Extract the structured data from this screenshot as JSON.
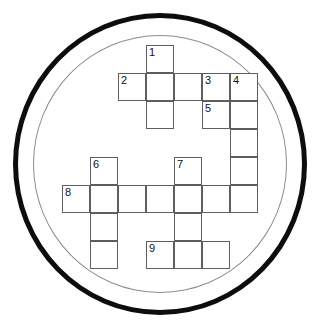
{
  "puzzle": {
    "title": "Circular Crossword Grid",
    "shape": "circle",
    "type": "crossword",
    "cell_size": 28,
    "origin_x": 62,
    "origin_y": 45,
    "columns": 7,
    "rows": 8,
    "frame": {
      "outer_ring_color": "#0d0d0d",
      "outer_ring_width": 5,
      "inner_ring_color": "#8c8c8c",
      "inner_ring_width": 1,
      "background": "#ffffff"
    },
    "grid_line_color": "#5e5e5e",
    "cell_fill": "#ffffff",
    "number_color": "#111111",
    "clue_numbers": [
      "1",
      "2",
      "3",
      "4",
      "5",
      "6",
      "7",
      "8",
      "9"
    ],
    "entries": [
      {
        "number": "1",
        "direction": "down",
        "row": 0,
        "col": 3,
        "length": 3
      },
      {
        "number": "2",
        "direction": "across",
        "row": 1,
        "col": 2,
        "length": 5
      },
      {
        "number": "3",
        "direction": "down",
        "row": 1,
        "col": 5,
        "length": 2
      },
      {
        "number": "4",
        "direction": "down",
        "row": 1,
        "col": 6,
        "length": 5
      },
      {
        "number": "5",
        "direction": "across",
        "row": 2,
        "col": 5,
        "length": 2
      },
      {
        "number": "6",
        "direction": "down",
        "row": 4,
        "col": 1,
        "length": 5
      },
      {
        "number": "7",
        "direction": "down",
        "row": 4,
        "col": 4,
        "length": 4
      },
      {
        "number": "8",
        "direction": "across",
        "row": 5,
        "col": 0,
        "length": 7
      },
      {
        "number": "9",
        "direction": "across",
        "row": 7,
        "col": 3,
        "length": 3
      }
    ],
    "cells": [
      {
        "row": 0,
        "col": 3,
        "number": "1",
        "letter": ""
      },
      {
        "row": 1,
        "col": 2,
        "number": "2",
        "letter": ""
      },
      {
        "row": 1,
        "col": 3,
        "number": "",
        "letter": ""
      },
      {
        "row": 1,
        "col": 4,
        "number": "",
        "letter": ""
      },
      {
        "row": 1,
        "col": 5,
        "number": "3",
        "letter": ""
      },
      {
        "row": 1,
        "col": 6,
        "number": "4",
        "letter": ""
      },
      {
        "row": 2,
        "col": 3,
        "number": "",
        "letter": ""
      },
      {
        "row": 2,
        "col": 5,
        "number": "5",
        "letter": ""
      },
      {
        "row": 2,
        "col": 6,
        "number": "",
        "letter": ""
      },
      {
        "row": 3,
        "col": 6,
        "number": "",
        "letter": ""
      },
      {
        "row": 4,
        "col": 1,
        "number": "6",
        "letter": ""
      },
      {
        "row": 4,
        "col": 4,
        "number": "7",
        "letter": ""
      },
      {
        "row": 4,
        "col": 6,
        "number": "",
        "letter": ""
      },
      {
        "row": 5,
        "col": 0,
        "number": "8",
        "letter": ""
      },
      {
        "row": 5,
        "col": 1,
        "number": "",
        "letter": ""
      },
      {
        "row": 5,
        "col": 2,
        "number": "",
        "letter": ""
      },
      {
        "row": 5,
        "col": 3,
        "number": "",
        "letter": ""
      },
      {
        "row": 5,
        "col": 4,
        "number": "",
        "letter": ""
      },
      {
        "row": 5,
        "col": 5,
        "number": "",
        "letter": ""
      },
      {
        "row": 5,
        "col": 6,
        "number": "",
        "letter": ""
      },
      {
        "row": 6,
        "col": 1,
        "number": "",
        "letter": ""
      },
      {
        "row": 6,
        "col": 4,
        "number": "",
        "letter": ""
      },
      {
        "row": 7,
        "col": 1,
        "number": "",
        "letter": ""
      },
      {
        "row": 7,
        "col": 3,
        "number": "9",
        "letter": ""
      },
      {
        "row": 7,
        "col": 4,
        "number": "",
        "letter": ""
      },
      {
        "row": 7,
        "col": 5,
        "number": "",
        "letter": ""
      }
    ]
  }
}
